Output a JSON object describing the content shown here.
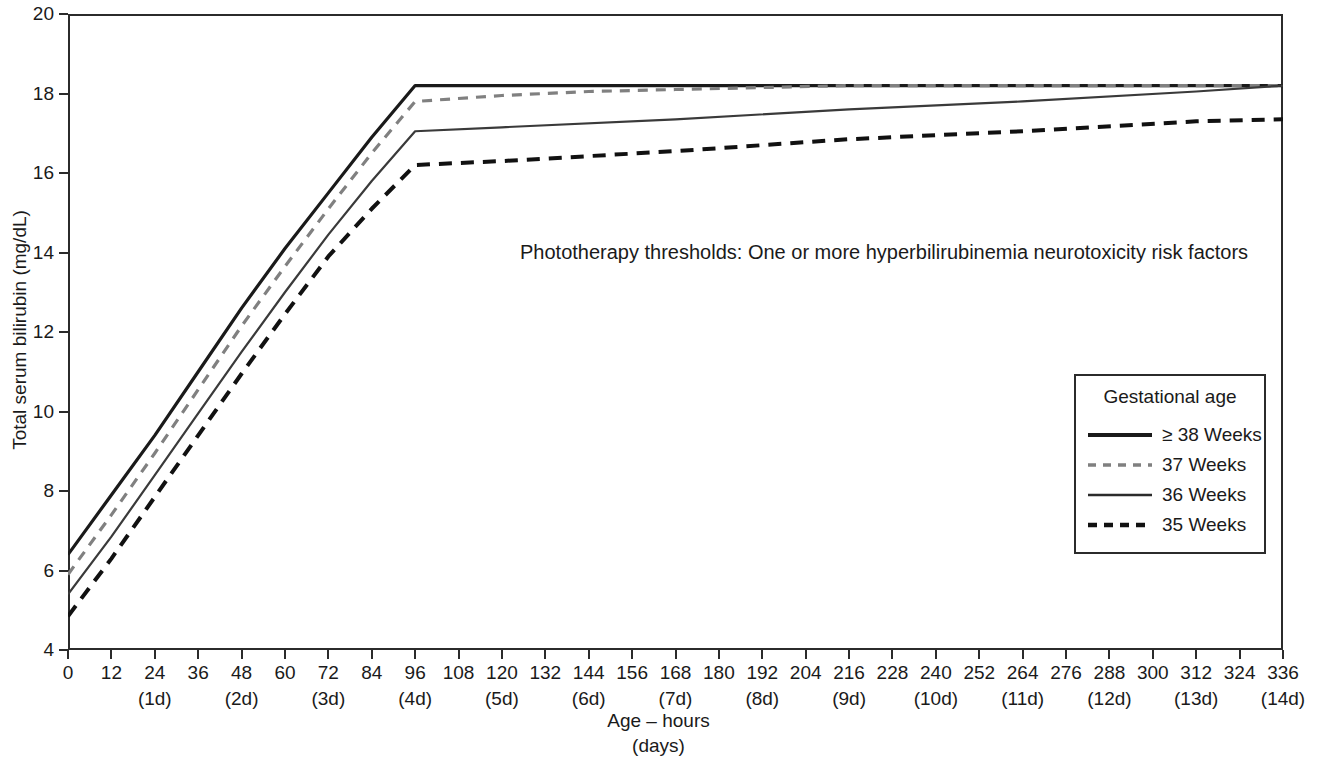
{
  "chart_data": {
    "type": "line",
    "title": "Phototherapy thresholds: One or more hyperbilirubinemia neurotoxicity risk factors",
    "xlabel_line1": "Age – hours",
    "xlabel_line2": "(days)",
    "ylabel": "Total serum bilirubin (mg/dL)",
    "xlim": [
      0,
      336
    ],
    "ylim": [
      4,
      20
    ],
    "grid": false,
    "legend_position": "inside-right",
    "legend_title": "Gestational age",
    "xticks": [
      0,
      12,
      24,
      36,
      48,
      60,
      72,
      84,
      96,
      108,
      120,
      132,
      144,
      156,
      168,
      180,
      192,
      204,
      216,
      228,
      240,
      252,
      264,
      276,
      288,
      300,
      312,
      324,
      336
    ],
    "xtick_labels": [
      "0",
      "12",
      "24",
      "36",
      "48",
      "60",
      "72",
      "84",
      "96",
      "108",
      "120",
      "132",
      "144",
      "156",
      "168",
      "180",
      "192",
      "204",
      "216",
      "228",
      "240",
      "252",
      "264",
      "276",
      "288",
      "300",
      "312",
      "324",
      "336"
    ],
    "xtick_day_labels": [
      {
        "x": 24,
        "label": "(1d)"
      },
      {
        "x": 48,
        "label": "(2d)"
      },
      {
        "x": 72,
        "label": "(3d)"
      },
      {
        "x": 96,
        "label": "(4d)"
      },
      {
        "x": 120,
        "label": "(5d)"
      },
      {
        "x": 144,
        "label": "(6d)"
      },
      {
        "x": 168,
        "label": "(7d)"
      },
      {
        "x": 192,
        "label": "(8d)"
      },
      {
        "x": 216,
        "label": "(9d)"
      },
      {
        "x": 240,
        "label": "(10d)"
      },
      {
        "x": 264,
        "label": "(11d)"
      },
      {
        "x": 288,
        "label": "(12d)"
      },
      {
        "x": 312,
        "label": "(13d)"
      },
      {
        "x": 336,
        "label": "(14d)"
      }
    ],
    "yticks": [
      4,
      6,
      8,
      10,
      12,
      14,
      16,
      18,
      20
    ],
    "ytick_labels": [
      "4",
      "6",
      "8",
      "10",
      "12",
      "14",
      "16",
      "18",
      "20"
    ],
    "series": [
      {
        "name": "≥ 38 Weeks",
        "style": "solid",
        "color": "#1a1a1a",
        "width": 3.2,
        "x": [
          0,
          12,
          24,
          36,
          48,
          60,
          72,
          84,
          96,
          120,
          168,
          216,
          264,
          312,
          336
        ],
        "values": [
          6.4,
          7.9,
          9.4,
          11.0,
          12.6,
          14.1,
          15.5,
          16.9,
          18.2,
          18.2,
          18.2,
          18.2,
          18.2,
          18.2,
          18.2
        ]
      },
      {
        "name": "37 Weeks",
        "style": "dashed",
        "color": "#808080",
        "width": 3.2,
        "x": [
          0,
          12,
          24,
          36,
          48,
          60,
          72,
          84,
          96,
          120,
          144,
          168,
          192,
          216,
          264,
          312,
          336
        ],
        "values": [
          5.9,
          7.4,
          8.95,
          10.55,
          12.15,
          13.65,
          15.1,
          16.5,
          17.8,
          17.95,
          18.05,
          18.1,
          18.15,
          18.2,
          18.2,
          18.2,
          18.2
        ]
      },
      {
        "name": "36 Weeks",
        "style": "solid",
        "color": "#3a3a3a",
        "width": 2.2,
        "x": [
          0,
          12,
          24,
          36,
          48,
          60,
          72,
          84,
          96,
          120,
          168,
          216,
          264,
          312,
          336
        ],
        "values": [
          5.4,
          6.85,
          8.4,
          9.95,
          11.5,
          13.0,
          14.45,
          15.8,
          17.05,
          17.15,
          17.35,
          17.6,
          17.8,
          18.05,
          18.2
        ]
      },
      {
        "name": "35 Weeks",
        "style": "dashed",
        "color": "#111111",
        "width": 4.0,
        "x": [
          0,
          12,
          24,
          36,
          48,
          60,
          72,
          84,
          96,
          120,
          168,
          216,
          264,
          312,
          336
        ],
        "values": [
          4.85,
          6.3,
          7.85,
          9.4,
          10.95,
          12.45,
          13.9,
          15.1,
          16.2,
          16.3,
          16.55,
          16.85,
          17.05,
          17.3,
          17.35
        ]
      }
    ],
    "legend_entries": [
      {
        "label": "≥ 38 Weeks",
        "style": "solid",
        "color": "#1a1a1a",
        "width": 4
      },
      {
        "label": "37 Weeks",
        "style": "dashed",
        "color": "#808080",
        "width": 3.5
      },
      {
        "label": "36 Weeks",
        "style": "solid",
        "color": "#2b2b2b",
        "width": 2.5
      },
      {
        "label": "35 Weeks",
        "style": "dashed",
        "color": "#111111",
        "width": 4.5
      }
    ]
  }
}
